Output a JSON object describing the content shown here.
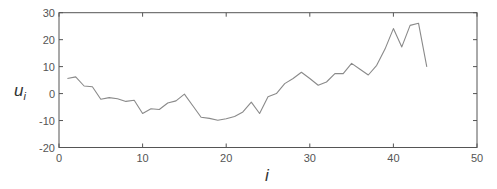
{
  "chart_data": {
    "type": "line",
    "title": "",
    "xlabel": "i",
    "ylabel": "u_i",
    "ylabel_main": "u",
    "ylabel_sub": "i",
    "xlim": [
      0,
      50
    ],
    "ylim": [
      -20,
      30
    ],
    "x_ticks": [
      0,
      10,
      20,
      30,
      40,
      50
    ],
    "y_ticks": [
      -20,
      -10,
      0,
      10,
      20,
      30
    ],
    "grid": false,
    "legend": null,
    "series": [
      {
        "name": "u_i",
        "color": "#8a8a8a",
        "x": [
          1,
          2,
          3,
          4,
          5,
          6,
          7,
          8,
          9,
          10,
          11,
          12,
          13,
          14,
          15,
          16,
          17,
          18,
          19,
          20,
          21,
          22,
          23,
          24,
          25,
          26,
          27,
          28,
          29,
          30,
          31,
          32,
          33,
          34,
          35,
          36,
          37,
          38,
          39,
          40,
          41,
          42,
          43,
          44
        ],
        "values": [
          5.6,
          6.2,
          2.8,
          2.5,
          -2.1,
          -1.5,
          -1.9,
          -2.9,
          -2.5,
          -7.4,
          -5.6,
          -5.9,
          -3.5,
          -2.7,
          -0.2,
          -4.5,
          -8.8,
          -9.2,
          -9.9,
          -9.3,
          -8.5,
          -6.8,
          -3.2,
          -7.4,
          -1.2,
          0.0,
          3.7,
          5.6,
          7.9,
          5.6,
          3.1,
          4.3,
          7.4,
          7.4,
          11.2,
          9.0,
          6.9,
          10.5,
          16.5,
          24.1,
          17.3,
          25.3,
          26.1,
          9.9
        ]
      }
    ]
  },
  "colors": {
    "axis": "#555555",
    "line": "#8a8a8a",
    "text": "#555555"
  }
}
